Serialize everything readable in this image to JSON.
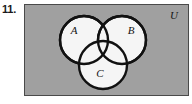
{
  "figure": {
    "exercise_number": "11.",
    "universe_label": "U",
    "universe_fill": "#a0a0a0",
    "universe_border": "#4a4a4a",
    "circle_fill": "#f5f5f5",
    "circle_stroke": "#111111",
    "page_background": "#ffffff",
    "universe_rect": {
      "x": 24,
      "y": 4,
      "width": 165,
      "height": 92
    },
    "circles": [
      {
        "label": "A",
        "cx": 84,
        "cy": 40,
        "r": 24,
        "label_x": 74,
        "label_y": 34
      },
      {
        "label": "B",
        "cx": 122,
        "cy": 40,
        "r": 24,
        "label_x": 131,
        "label_y": 34
      },
      {
        "label": "C",
        "cx": 103,
        "cy": 65,
        "r": 24,
        "label_x": 100,
        "label_y": 77
      }
    ],
    "universe_label_pos": {
      "x": 174,
      "y": 19
    }
  }
}
